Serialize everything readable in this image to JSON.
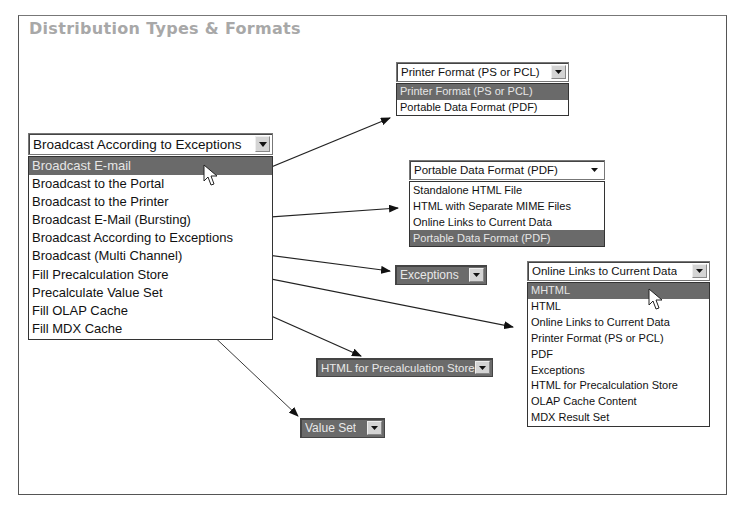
{
  "title": "Distribution Types & Formats",
  "main_select": {
    "value": "Broadcast According to Exceptions",
    "items": [
      "Broadcast E-mail",
      "Broadcast to the Portal",
      "Broadcast to the Printer",
      "Broadcast E-Mail (Bursting)",
      "Broadcast According to Exceptions",
      "Broadcast (Multi Channel)",
      "Fill Precalculation Store",
      "Precalculate Value Set",
      "Fill OLAP Cache",
      "Fill MDX Cache"
    ],
    "selected_index": 0
  },
  "printer_select": {
    "value": "Printer Format (PS or PCL)",
    "items": [
      "Printer Format (PS or PCL)",
      "Portable Data Format (PDF)"
    ],
    "selected_index": 0
  },
  "pdf_select": {
    "value": "Portable Data Format (PDF)",
    "items": [
      "Standalone HTML File",
      "HTML with Separate MIME Files",
      "Online Links to Current Data",
      "Portable Data Format (PDF)"
    ],
    "selected_index": 3
  },
  "exceptions_select": {
    "value": "Exceptions"
  },
  "precalc_select": {
    "value": "HTML for Precalculation Store"
  },
  "valueset_select": {
    "value": "Value Set"
  },
  "multichannel_select": {
    "value": "Online Links to Current Data",
    "items": [
      "MHTML",
      "HTML",
      "Online Links to Current Data",
      "Printer Format (PS or PCL)",
      "PDF",
      "Exceptions",
      "HTML for Precalculation Store",
      "OLAP Cache Content",
      "MDX Result Set"
    ],
    "selected_index": 0
  },
  "icons": {
    "dropdown": "chevron-down-icon",
    "pointer": "mouse-pointer-icon",
    "arrow": "arrow-connector-icon"
  },
  "colors": {
    "selected_bg": "#6a6a6a",
    "title": "#a8a8a8",
    "frame": "#555555"
  }
}
